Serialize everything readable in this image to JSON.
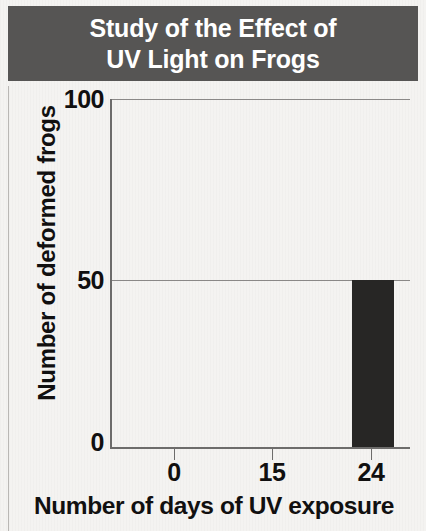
{
  "chart_data": {
    "type": "bar",
    "title": "Study of the Effect of\nUV Light on Frogs",
    "title_line1": "Study of the Effect of",
    "title_line2": "UV Light on Frogs",
    "xlabel": "Number of days of UV exposure",
    "ylabel": "Number of deformed frogs",
    "categories": [
      "0",
      "15",
      "24"
    ],
    "x": [
      0,
      15,
      24
    ],
    "values": [
      0,
      0,
      48
    ],
    "xtick_labels": [
      "0",
      "15",
      "24"
    ],
    "ytick_labels": [
      "0",
      "50",
      "100"
    ],
    "yticks": [
      0,
      50,
      100
    ],
    "ylim": [
      0,
      100
    ],
    "grid": "horizontal",
    "legend": "none",
    "bar_color": "#272625",
    "banner_color": "#565554",
    "banner_text_color": "#ffffff",
    "axis_color": "#6d6c6b",
    "background_color": "#f4f3f1"
  }
}
